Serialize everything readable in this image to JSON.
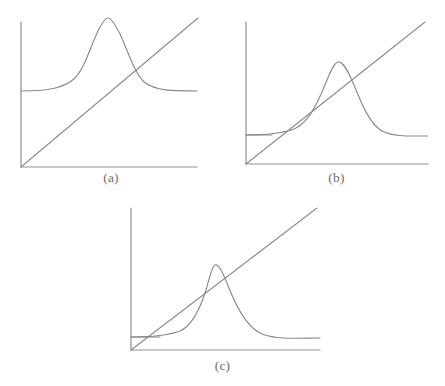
{
  "figure": {
    "title": "",
    "background_color": "#ffffff",
    "stroke_color": "#8a8a8a",
    "caption_color": "#6e6e6e",
    "panel_count": 3
  },
  "panels": [
    {
      "id": "a",
      "caption": "(a)",
      "description": "Gaussian bump with high baseline crossing a straight diagonal line once, far to the right of the peak",
      "axes": {
        "origin": [
          21,
          167
        ],
        "x_axis_end": [
          197,
          167
        ],
        "y_axis_top": [
          21,
          22
        ],
        "show_ticks": false,
        "show_labels": false
      },
      "curve": {
        "type": "gaussian",
        "baseline_y": 91,
        "peak": [
          108,
          18
        ],
        "left_start_x": 21,
        "right_end_x": 197,
        "width": 30
      },
      "diagonal": {
        "from": [
          21,
          167
        ],
        "to": [
          198,
          18
        ]
      },
      "asymptote": {
        "visible": false,
        "y": 91
      },
      "intersections": 1
    },
    {
      "id": "b",
      "caption": "(b)",
      "description": "Gaussian bump with low baseline tangent to the diagonal line on the rising flank, then crossing once",
      "axes": {
        "origin": [
          18,
          164
        ],
        "x_axis_end": [
          200,
          164
        ],
        "y_axis_top": [
          18,
          22
        ],
        "show_ticks": false,
        "show_labels": false
      },
      "curve": {
        "type": "gaussian",
        "baseline_y": 135,
        "peak": [
          110,
          62
        ],
        "left_start_x": 18,
        "right_end_x": 200,
        "width": 24
      },
      "diagonal": {
        "from": [
          18,
          164
        ],
        "to": [
          197,
          22
        ]
      },
      "asymptote": {
        "visible": true,
        "y": 135,
        "from_x": 18,
        "to_x": 44
      },
      "intersections": 2
    },
    {
      "id": "c",
      "caption": "(c)",
      "description": "Gaussian bump with low baseline crossed by a steep diagonal line at three points",
      "axes": {
        "origin": [
          21,
          157
        ],
        "x_axis_end": [
          210,
          157
        ],
        "y_axis_top": [
          21,
          15
        ],
        "show_ticks": false,
        "show_labels": false
      },
      "curve": {
        "type": "gaussian",
        "baseline_y": 144,
        "peak": [
          105,
          72
        ],
        "left_start_x": 21,
        "right_end_x": 210,
        "width": 24
      },
      "diagonal": {
        "from": [
          21,
          157
        ],
        "to": [
          207,
          15
        ]
      },
      "asymptote": {
        "visible": true,
        "y": 144,
        "from_x": 21,
        "to_x": 50
      },
      "intersections": 3
    }
  ]
}
